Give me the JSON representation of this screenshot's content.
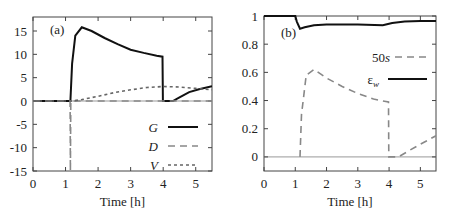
{
  "chart_data": [
    {
      "type": "line",
      "panel_label": "(a)",
      "xlabel": "Time [h]",
      "ylabel": "",
      "xlim": [
        0,
        5.5
      ],
      "ylim": [
        -15,
        18
      ],
      "xticks": [
        "0",
        "1",
        "2",
        "3",
        "4",
        "5"
      ],
      "yticks": [
        "15",
        "10",
        "5",
        "0",
        "-5",
        "-10",
        "-15"
      ],
      "legend": [
        "G",
        "D",
        "V"
      ],
      "legend_position": "lower right",
      "series": [
        {
          "name": "G",
          "style": "solid",
          "x": [
            0,
            1.15,
            1.2,
            1.3,
            1.5,
            1.8,
            2.2,
            2.6,
            3.0,
            3.4,
            3.8,
            3.98,
            3.99,
            4.3,
            4.5,
            4.8,
            5.1,
            5.5
          ],
          "values": [
            0,
            0,
            8,
            14,
            15.8,
            15,
            13.5,
            12.2,
            11,
            10.3,
            9.7,
            9.5,
            0,
            0,
            0.8,
            1.9,
            2.5,
            3.2
          ]
        },
        {
          "name": "D",
          "style": "dashed",
          "x": [
            0,
            1.14,
            1.15,
            1.16,
            5.5
          ],
          "values": [
            0,
            0,
            -15,
            0,
            0
          ]
        },
        {
          "name": "V",
          "style": "dotted",
          "x": [
            0,
            1.2,
            1.5,
            2,
            2.5,
            3,
            3.5,
            4,
            4.5,
            5,
            5.5
          ],
          "values": [
            0,
            0,
            0.3,
            1.0,
            1.8,
            2.4,
            2.9,
            3.1,
            3.0,
            2.7,
            2.4
          ]
        }
      ]
    },
    {
      "type": "line",
      "panel_label": "(b)",
      "xlabel": "Time [h]",
      "ylabel": "",
      "xlim": [
        0,
        5.5
      ],
      "ylim": [
        -0.1,
        1
      ],
      "xticks": [
        "0",
        "1",
        "2",
        "3",
        "4",
        "5"
      ],
      "yticks": [
        "1",
        "0.8",
        "0.6",
        "0.4",
        "0.2",
        "0"
      ],
      "legend": [
        "50s",
        "ε_w"
      ],
      "legend_position": "upper right",
      "series": [
        {
          "name": "50s",
          "style": "dashed",
          "x": [
            1.15,
            1.2,
            1.35,
            1.6,
            2.0,
            2.5,
            3.0,
            3.5,
            3.98,
            3.99,
            4.3,
            4.6,
            5.0,
            5.5
          ],
          "values": [
            0,
            0.3,
            0.58,
            0.62,
            0.56,
            0.5,
            0.45,
            0.41,
            0.39,
            0,
            0,
            0.04,
            0.09,
            0.15
          ]
        },
        {
          "name": "ε_w",
          "style": "solid",
          "x": [
            0,
            1.0,
            1.05,
            1.15,
            1.3,
            1.6,
            2,
            3,
            3.8,
            4.1,
            4.5,
            5,
            5.5
          ],
          "values": [
            1,
            1,
            0.96,
            0.91,
            0.92,
            0.935,
            0.94,
            0.94,
            0.935,
            0.95,
            0.96,
            0.965,
            0.965
          ]
        }
      ]
    }
  ]
}
